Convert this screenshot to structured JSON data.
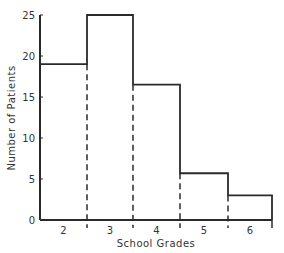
{
  "chart_data": {
    "type": "bar",
    "title": "",
    "xlabel": "School Grades",
    "ylabel": "Number of Patients",
    "categories": [
      "2",
      "3",
      "4",
      "5",
      "6"
    ],
    "values": [
      19,
      25,
      16.5,
      5.7,
      3
    ],
    "ylim": [
      0,
      25
    ],
    "yticks": [
      0,
      5,
      10,
      15,
      20,
      25
    ],
    "grid": false,
    "legend": null,
    "style": "histogram with dashed inner bin dividers"
  },
  "axes": {
    "xlabel": "School Grades",
    "ylabel": "Number of Patients",
    "ytick_labels": [
      "0",
      "5",
      "10",
      "15",
      "20",
      "25"
    ],
    "xtick_labels": [
      "2",
      "3",
      "4",
      "5",
      "6"
    ]
  }
}
